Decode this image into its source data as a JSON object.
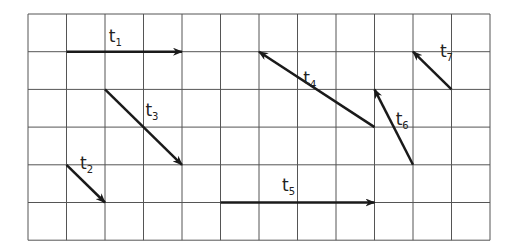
{
  "grid": {
    "left": 28,
    "top": 14,
    "cols": 12,
    "rows": 6,
    "cell_w": 38.5,
    "cell_h": 37.7,
    "line_color": "#555555"
  },
  "vectors": [
    {
      "name": "t",
      "sub": "1",
      "from": [
        1,
        1
      ],
      "to": [
        4,
        1
      ],
      "label_pos": [
        2.1,
        0.75
      ]
    },
    {
      "name": "t",
      "sub": "2",
      "from": [
        1,
        4
      ],
      "to": [
        2,
        5
      ],
      "label_pos": [
        1.35,
        4.1
      ]
    },
    {
      "name": "t",
      "sub": "3",
      "from": [
        2,
        2
      ],
      "to": [
        4,
        4
      ],
      "label_pos": [
        3.05,
        2.7
      ]
    },
    {
      "name": "t",
      "sub": "4",
      "from": [
        9,
        3
      ],
      "to": [
        6,
        1
      ],
      "label_pos": [
        7.15,
        1.85
      ]
    },
    {
      "name": "t",
      "sub": "5",
      "from": [
        5,
        5
      ],
      "to": [
        9,
        5
      ],
      "label_pos": [
        6.6,
        4.7
      ]
    },
    {
      "name": "t",
      "sub": "6",
      "from": [
        10,
        4
      ],
      "to": [
        9,
        2
      ],
      "label_pos": [
        9.55,
        2.95
      ]
    },
    {
      "name": "t",
      "sub": "7",
      "from": [
        11,
        2
      ],
      "to": [
        10,
        1
      ],
      "label_pos": [
        10.7,
        1.15
      ]
    }
  ],
  "colors": {
    "arrow": "#1a1a1a",
    "grid": "#555555"
  }
}
